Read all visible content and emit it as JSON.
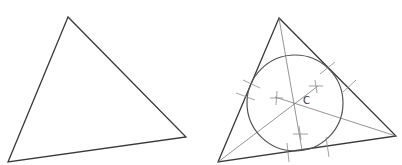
{
  "figure": {
    "left_panel": {
      "title": "triangle",
      "vertices": [
        [
          68,
          17
        ],
        [
          8,
          162
        ],
        [
          186,
          137
        ]
      ]
    },
    "right_panel": {
      "title": "triangle with incircle",
      "vertices": [
        [
          279,
          18
        ],
        [
          218,
          162
        ],
        [
          396,
          136
        ]
      ],
      "incenter_label": "C",
      "incenter": [
        295,
        103
      ],
      "inradius": 48,
      "colors": {
        "triangle": "#3a3a3a",
        "bisectors": "#7a7a7a",
        "circle": "#555555"
      }
    }
  }
}
